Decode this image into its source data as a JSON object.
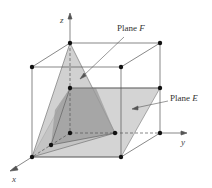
{
  "figure": {
    "type": "3D cube diagram with two intersecting planes",
    "axes": {
      "x": "x",
      "y": "y",
      "z": "z"
    },
    "labels": {
      "plane_f_prefix": "Plane ",
      "plane_f_name": "F",
      "plane_e_prefix": "Plane ",
      "plane_e_name": "E"
    },
    "colors": {
      "edge": "#555555",
      "plane_e_fill": "#c9c9c9",
      "plane_f_fill": "#b8b8b8",
      "overlap_fill": "#9a9a9a",
      "point": "#111111"
    }
  }
}
